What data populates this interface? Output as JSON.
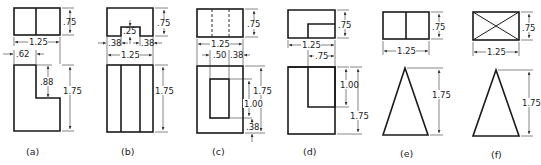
{
  "figure": {
    "panels": [
      {
        "id": "a",
        "caption": "(a)",
        "top_view": {
          "width": "1.25",
          "depth": ".75"
        },
        "front_view": {
          "height": "1.75",
          "notch_width": ".62",
          "notch_depth": ".88"
        }
      },
      {
        "id": "b",
        "caption": "(b)",
        "top_view": {
          "width": "1.25",
          "depth": ".75",
          "slot_depth": ".25",
          "left_offset": ".38",
          "right_offset": ".38"
        },
        "front_view": {
          "height": "1.75"
        }
      },
      {
        "id": "c",
        "caption": "(c)",
        "top_view": {
          "width": "1.25",
          "depth": ".75"
        },
        "front_view": {
          "height": "1.75",
          "hole_left": ".50",
          "hole_right": ".38",
          "hole_height": "1.00",
          "hole_bottom": ".38"
        }
      },
      {
        "id": "d",
        "caption": "(d)",
        "top_view": {
          "width": "1.25",
          "depth": ".75",
          "step_width": ".75"
        },
        "front_view": {
          "height": "1.75",
          "step_height": "1.00"
        }
      },
      {
        "id": "e",
        "caption": "(e)",
        "top_view": {
          "width": "1.25",
          "depth": ".75"
        },
        "front_view": {
          "height": "1.75",
          "shape": "triangle"
        }
      },
      {
        "id": "f",
        "caption": "(f)",
        "top_view": {
          "width": "1.25",
          "depth": ".75",
          "shape": "crossed-rectangle"
        },
        "front_view": {
          "height": "1.75",
          "shape": "triangle"
        }
      }
    ]
  }
}
